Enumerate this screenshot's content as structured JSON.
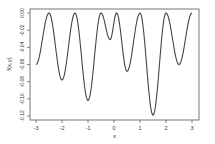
{
  "chart_data": {
    "type": "line",
    "title": "",
    "xlabel": "x",
    "ylabel": "f(x,y)",
    "xlim": [
      -3,
      3
    ],
    "ylim": [
      -0.12,
      0.0
    ],
    "xticks": [
      -3,
      -2,
      -1,
      0,
      1,
      2,
      3
    ],
    "xtick_labels": [
      "-3",
      "-2",
      "-1",
      "0",
      "1",
      "2",
      "3"
    ],
    "yticks": [
      0.0,
      -0.02,
      -0.04,
      -0.06,
      -0.08,
      -0.1,
      -0.12
    ],
    "ytick_labels": [
      "0.00",
      "-0.02",
      "-0.04",
      "-0.06",
      "-0.08",
      "-0.10",
      "-0.12"
    ],
    "grid": false,
    "legend": null,
    "series": [
      {
        "name": "f(x,y)",
        "color": "#444444",
        "x": [
          -3.0,
          -2.5,
          -2.0,
          -1.5,
          -1.0,
          -0.5,
          -0.15,
          0.1,
          0.5,
          1.0,
          1.5,
          2.0,
          2.5,
          3.0
        ],
        "y": [
          -0.06,
          0.0,
          -0.078,
          0.0,
          -0.102,
          0.0,
          -0.031,
          0.0,
          -0.068,
          0.0,
          -0.119,
          0.0,
          -0.06,
          0.0
        ]
      }
    ]
  }
}
